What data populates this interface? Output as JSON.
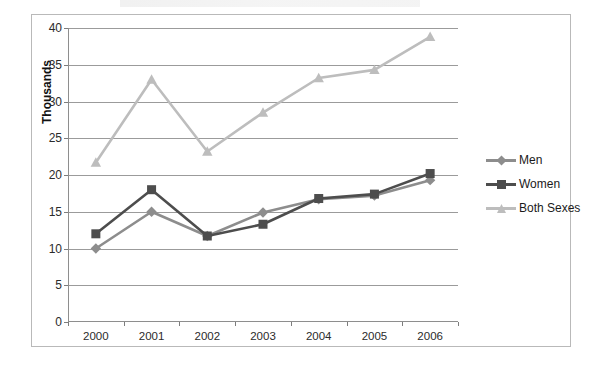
{
  "chart_data": {
    "type": "line",
    "title": "",
    "xlabel": "",
    "ylabel": "Thousands",
    "categories": [
      "2000",
      "2001",
      "2002",
      "2003",
      "2004",
      "2005",
      "2006"
    ],
    "ylim": [
      0,
      40
    ],
    "ytick_values": [
      0,
      5,
      10,
      15,
      20,
      25,
      30,
      35,
      40
    ],
    "ytick_labels": [
      "0",
      "5",
      "10",
      "15",
      "20",
      "25",
      "30",
      "35",
      "40"
    ],
    "grid": true,
    "legend_position": "right",
    "series": [
      {
        "name": "Men",
        "color": "#8d8d8d",
        "marker": "diamond",
        "values": [
          10.0,
          15.0,
          11.7,
          14.9,
          16.7,
          17.2,
          19.3
        ]
      },
      {
        "name": "Women",
        "color": "#4d4d4d",
        "marker": "square",
        "values": [
          12.0,
          18.0,
          11.7,
          13.3,
          16.8,
          17.4,
          20.2
        ]
      },
      {
        "name": "Both Sexes",
        "color": "#bdbdbd",
        "marker": "triangle",
        "values": [
          21.7,
          33.0,
          23.2,
          28.5,
          33.2,
          34.3,
          38.8
        ]
      }
    ]
  },
  "legend": {
    "items": [
      {
        "label": "Men"
      },
      {
        "label": "Women"
      },
      {
        "label": "Both Sexes"
      }
    ]
  },
  "axes": {
    "y_title": "Thousands"
  },
  "colors": {
    "gridline": "#9b9b9b",
    "axis": "#8e8e8e",
    "frame": "#b9b9b9",
    "text": "#2b2b2b",
    "background": "#ffffff"
  }
}
